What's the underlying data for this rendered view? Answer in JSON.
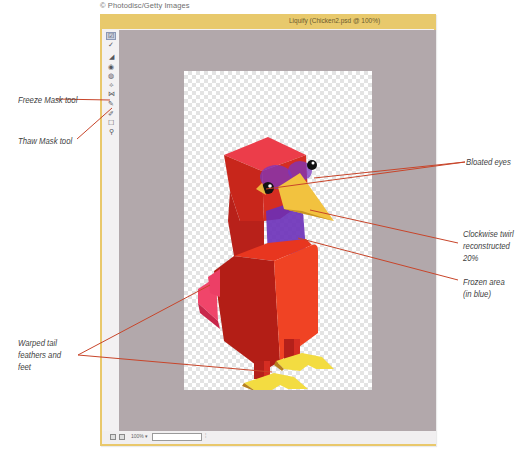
{
  "credit": "© Photodisc/Getty Images",
  "window": {
    "title": "Liquify (Chicken2.psd @ 100%)",
    "frame_color": "#e8c96c",
    "canvas_bg": "#b2a8ab"
  },
  "toolbar": {
    "tools": [
      {
        "name": "forward-warp-tool",
        "glyph": "☑",
        "selected": true
      },
      {
        "name": "reconstruct-tool",
        "glyph": "✓",
        "selected": false
      },
      {
        "name": "twirl-clockwise-tool",
        "glyph": "◢",
        "selected": false
      },
      {
        "name": "pucker-tool",
        "glyph": "◉",
        "selected": false
      },
      {
        "name": "bloat-tool",
        "glyph": "◍",
        "selected": false
      },
      {
        "name": "push-left-tool",
        "glyph": "⟡",
        "selected": false
      },
      {
        "name": "mirror-tool",
        "glyph": "⋈",
        "selected": false
      },
      {
        "name": "freeze-mask-tool",
        "glyph": "✎",
        "selected": false
      },
      {
        "name": "thaw-mask-tool",
        "glyph": "✐",
        "selected": false
      },
      {
        "name": "hand-tool",
        "glyph": "☐",
        "selected": false
      },
      {
        "name": "zoom-tool",
        "glyph": "⚲",
        "selected": false
      }
    ]
  },
  "statusbar": {
    "zoom_value": "100%",
    "zoom_arrow": "▾",
    "tick": "¦"
  },
  "callouts": {
    "freeze_mask": "Freeze Mask tool",
    "thaw_mask": "Thaw Mask tool",
    "bloated_eyes": "Bloated eyes",
    "twirl_line1": "Clockwise twirl",
    "twirl_line2": "reconstructed",
    "twirl_line3": "20%",
    "frozen_line1": "Frozen area",
    "frozen_line2": "(in blue)",
    "warped_line1": "Warped tail",
    "warped_line2": "feathers and",
    "warped_line3": "feet"
  },
  "colors": {
    "leader_line": "#c8452a",
    "frozen_mask": "#6a2fb8"
  }
}
